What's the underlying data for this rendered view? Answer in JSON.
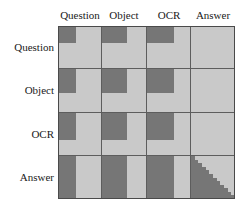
{
  "figure": {
    "title": "",
    "kind": "block-matrix-diagram"
  },
  "colors": {
    "background": "#ffffff",
    "cell_light": "#c9c9c9",
    "block_dark": "#767676",
    "gridline": "#5d5d5d",
    "frame": "#4a4a4a",
    "text": "#1a1a1a"
  },
  "axes": {
    "columns": [
      {
        "key": "question",
        "label": "Question"
      },
      {
        "key": "object",
        "label": "Object"
      },
      {
        "key": "ocr",
        "label": "OCR"
      },
      {
        "key": "answer",
        "label": "Answer"
      }
    ],
    "rows": [
      {
        "key": "question",
        "label": "Question"
      },
      {
        "key": "object",
        "label": "Object"
      },
      {
        "key": "ocr",
        "label": "OCR"
      },
      {
        "key": "answer",
        "label": "Answer"
      }
    ]
  },
  "chart_data": {
    "type": "heatmap",
    "title": "",
    "xlabel": "",
    "ylabel": "",
    "categories_x": [
      "Question",
      "Object",
      "OCR",
      "Answer"
    ],
    "categories_y": [
      "Question",
      "Object",
      "OCR",
      "Answer"
    ],
    "grid": true,
    "legend": "none",
    "note": "Each cell of the 4x4 attention-mask matrix is drawn light gray; dark gray sub-rectangles anchored at the cell's top-left encode the masked/attended sub-region. Values below give the dark block extent as a fraction of the cell width and height. The Answer/Answer cell is a lower-left staircase (causal) triangle instead of a rectangle.",
    "cells": [
      {
        "row": "Question",
        "col": "Question",
        "block": "rect",
        "w_frac": 0.4,
        "h_frac": 0.4
      },
      {
        "row": "Question",
        "col": "Object",
        "block": "rect",
        "w_frac": 0.55,
        "h_frac": 0.4
      },
      {
        "row": "Question",
        "col": "OCR",
        "block": "rect",
        "w_frac": 0.62,
        "h_frac": 0.4
      },
      {
        "row": "Question",
        "col": "Answer",
        "block": "none",
        "w_frac": 0.0,
        "h_frac": 0.0
      },
      {
        "row": "Object",
        "col": "Question",
        "block": "rect",
        "w_frac": 0.4,
        "h_frac": 0.55
      },
      {
        "row": "Object",
        "col": "Object",
        "block": "rect",
        "w_frac": 0.55,
        "h_frac": 0.55
      },
      {
        "row": "Object",
        "col": "OCR",
        "block": "rect",
        "w_frac": 0.62,
        "h_frac": 0.55
      },
      {
        "row": "Object",
        "col": "Answer",
        "block": "none",
        "w_frac": 0.0,
        "h_frac": 0.0
      },
      {
        "row": "OCR",
        "col": "Question",
        "block": "rect",
        "w_frac": 0.4,
        "h_frac": 0.62
      },
      {
        "row": "OCR",
        "col": "Object",
        "block": "rect",
        "w_frac": 0.55,
        "h_frac": 0.62
      },
      {
        "row": "OCR",
        "col": "OCR",
        "block": "rect",
        "w_frac": 0.62,
        "h_frac": 0.62
      },
      {
        "row": "OCR",
        "col": "Answer",
        "block": "none",
        "w_frac": 0.0,
        "h_frac": 0.0
      },
      {
        "row": "Answer",
        "col": "Question",
        "block": "rect",
        "w_frac": 0.4,
        "h_frac": 1.0
      },
      {
        "row": "Answer",
        "col": "Object",
        "block": "rect",
        "w_frac": 0.55,
        "h_frac": 1.0
      },
      {
        "row": "Answer",
        "col": "OCR",
        "block": "rect",
        "w_frac": 0.62,
        "h_frac": 1.0
      },
      {
        "row": "Answer",
        "col": "Answer",
        "block": "stair",
        "w_frac": 1.0,
        "h_frac": 1.0,
        "steps": 12
      }
    ]
  }
}
